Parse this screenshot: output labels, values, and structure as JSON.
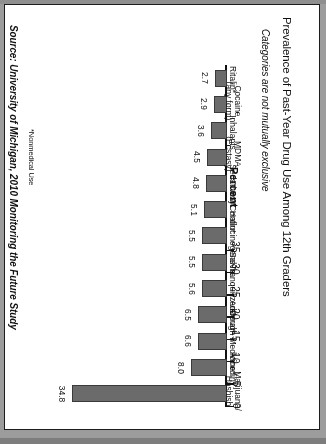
{
  "chart_data": {
    "type": "bar",
    "orientation": "horizontal",
    "title": "Prevalence of Past-Year Drug Use Among 12th Graders",
    "subtitle": "Categories are not mutually exclusive",
    "xlabel": "Percent",
    "ylabel": "",
    "ylim": [
      0,
      35
    ],
    "grid": false,
    "legend": "none",
    "page_rotation_degrees": 180,
    "bar_color": "#6b6b6b",
    "bar_edge_color": "#3a3a3a",
    "axis_color": "#111111",
    "background": "#ffffff",
    "tick_labels": [
      "0",
      "5",
      "10",
      "15",
      "20",
      "25",
      "30",
      "35"
    ],
    "tick_values": [
      0,
      5,
      10,
      15,
      20,
      25,
      30,
      35
    ],
    "categories": [
      "Marijuana/\nHashish",
      "Vicodin*",
      "Cough Medicine*",
      "Adderal*",
      "Tranquilizers*",
      "Salvia",
      "Hallucinogens",
      "OxyContin*",
      "Sedatives*",
      "MDMA\n(Ecstasy)",
      "Inhalants",
      "Cocaine\n(any form)",
      "Ritalin*"
    ],
    "values": [
      34.8,
      8.0,
      6.6,
      6.5,
      5.6,
      5.5,
      5.5,
      5.1,
      4.8,
      4.5,
      3.6,
      2.9,
      2.7
    ],
    "value_labels": [
      "34.8",
      "8.0",
      "6.6",
      "6.5",
      "5.6",
      "5.5",
      "5.5",
      "5.1",
      "4.8",
      "4.5",
      "3.6",
      "2.9",
      "2.7"
    ],
    "footnote": "*Nonmedical Use",
    "source": "Source: University of Michigan, 2010 Monitoring the Future Study"
  }
}
